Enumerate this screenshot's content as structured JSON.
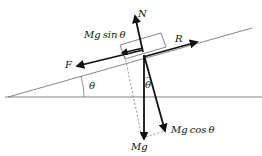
{
  "diagram": {
    "labels": {
      "N": "N",
      "R": "R",
      "F": "F",
      "mg_sin": "Mg sin θ",
      "mg_sin_a": "Mg",
      "mg_sin_b": "sin",
      "mg_sin_c": "θ",
      "mg_cos_a": "Mg",
      "mg_cos_b": "cos",
      "mg_cos_c": "θ",
      "Mg": "Mg",
      "theta_incline": "θ",
      "theta_vertical": "θ"
    },
    "colors": {
      "line": "#111111",
      "thin": "#555555"
    }
  }
}
